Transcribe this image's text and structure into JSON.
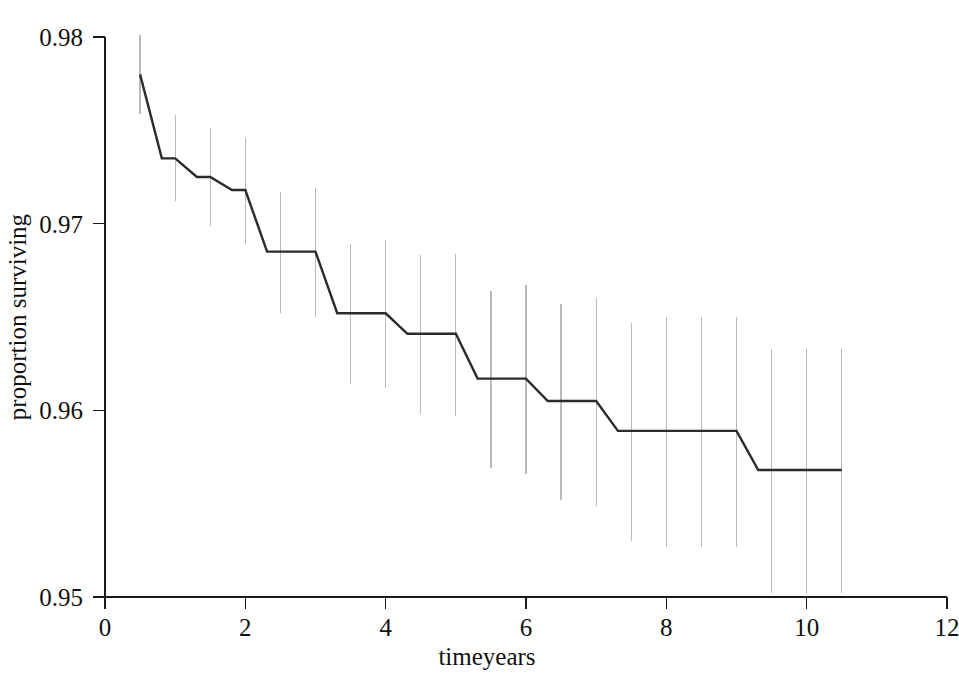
{
  "chart_data": {
    "type": "line",
    "title": "",
    "subtitle": "",
    "xlabel": "timeyears",
    "ylabel": "proportion surviving",
    "xlim": [
      0,
      12
    ],
    "ylim": [
      0.95,
      0.98
    ],
    "grid": false,
    "legend": null,
    "step_style": "post",
    "x_ticks": [
      {
        "value": 0,
        "label": "0"
      },
      {
        "value": 2,
        "label": "2"
      },
      {
        "value": 4,
        "label": "4"
      },
      {
        "value": 6,
        "label": "6"
      },
      {
        "value": 8,
        "label": "8"
      },
      {
        "value": 10,
        "label": "10"
      },
      {
        "value": 12,
        "label": "12"
      }
    ],
    "y_ticks": [
      {
        "value": 0.95,
        "label": "0.95"
      },
      {
        "value": 0.96,
        "label": "0.96"
      },
      {
        "value": 0.97,
        "label": "0.97"
      },
      {
        "value": 0.98,
        "label": "0.98"
      }
    ],
    "series": [
      {
        "name": "proportion surviving",
        "color": "#2b2b2b",
        "errorbar_color": "#b9b9b9",
        "x": [
          0.5,
          1.0,
          1.5,
          2.0,
          2.5,
          3.0,
          3.5,
          4.0,
          4.5,
          5.0,
          5.5,
          6.0,
          6.5,
          7.0,
          7.5,
          8.0,
          8.5,
          9.0,
          9.5,
          10.0,
          10.5
        ],
        "values": [
          0.978,
          0.9735,
          0.9725,
          0.9718,
          0.9685,
          0.9685,
          0.9652,
          0.9652,
          0.9641,
          0.9641,
          0.9617,
          0.9617,
          0.9605,
          0.9605,
          0.9589,
          0.9589,
          0.9589,
          0.9589,
          0.9568,
          0.9568,
          0.9568
        ],
        "ci_lower": [
          0.9759,
          0.9712,
          0.9699,
          0.9689,
          0.9652,
          0.965,
          0.9614,
          0.9612,
          0.9598,
          0.9597,
          0.9569,
          0.9566,
          0.9552,
          0.9549,
          0.953,
          0.9527,
          0.9527,
          0.9527,
          0.9502,
          0.9502,
          0.9502
        ],
        "ci_upper": [
          0.9801,
          0.9758,
          0.9751,
          0.9746,
          0.9717,
          0.9719,
          0.9689,
          0.9691,
          0.9683,
          0.9684,
          0.9664,
          0.9667,
          0.9657,
          0.966,
          0.9647,
          0.965,
          0.965,
          0.965,
          0.9633,
          0.9633,
          0.9633
        ]
      }
    ]
  }
}
